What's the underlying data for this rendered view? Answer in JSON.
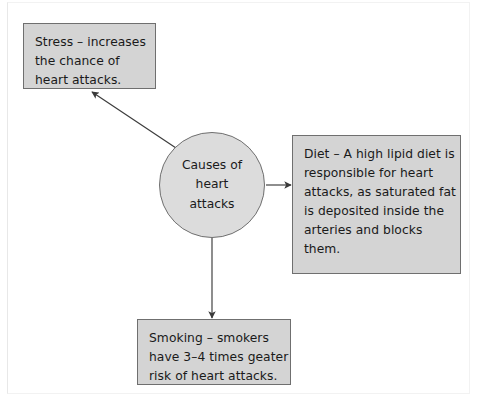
{
  "diagram": {
    "type": "concept-map",
    "title": "Causes of heart attacks",
    "center": {
      "id": "causes-of-heart-attacks",
      "shape": "circle",
      "text": "Causes of\nheart\nattacks",
      "fill": "#dcdcdc",
      "stroke": "#6f6f6f"
    },
    "nodes": [
      {
        "id": "stress",
        "shape": "rectangle",
        "text": "Stress – increases\nthe chance of\nheart attacks.",
        "fill": "#d4d4d4",
        "stroke": "#6f6f6f",
        "position": "top-left"
      },
      {
        "id": "diet",
        "shape": "rectangle",
        "text": "Diet – A high lipid diet is\nresponsible for heart\nattacks, as saturated fat\nis deposited inside the\narteries and blocks\nthem.",
        "fill": "#d4d4d4",
        "stroke": "#6f6f6f",
        "position": "right"
      },
      {
        "id": "smoking",
        "shape": "rectangle",
        "text": "Smoking – smokers\nhave 3–4 times geater\nrisk of heart attacks.",
        "fill": "#d4d4d4",
        "stroke": "#6f6f6f",
        "position": "bottom"
      }
    ],
    "connectors": [
      {
        "id": "arrow-to-stress",
        "from": "causes-of-heart-attacks",
        "to": "stress",
        "direction": "up-left",
        "style": "solid-line-filled-arrowhead",
        "color": "#3a3a3a"
      },
      {
        "id": "arrow-to-diet",
        "from": "causes-of-heart-attacks",
        "to": "diet",
        "direction": "right",
        "style": "solid-line-filled-arrowhead",
        "color": "#3a3a3a"
      },
      {
        "id": "arrow-to-smoking",
        "from": "causes-of-heart-attacks",
        "to": "smoking",
        "direction": "down",
        "style": "solid-line-filled-arrowhead",
        "color": "#3a3a3a"
      }
    ],
    "background": "#ffffff"
  }
}
